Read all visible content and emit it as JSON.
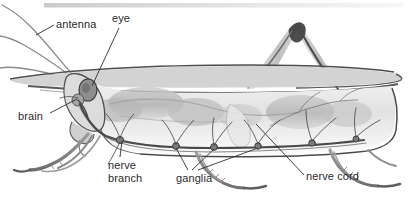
{
  "figure": {
    "width": 415,
    "height": 202,
    "background_color": "#ffffff",
    "ink_color": "#2b2b2b",
    "shading_color": "#9a9a9a"
  },
  "labels": {
    "antenna": "antenna",
    "eye": "eye",
    "brain": "brain",
    "nerve_branch_line1": "nerve",
    "nerve_branch_line2": "branch",
    "ganglia": "ganglia",
    "nerve_cord": "nerve cord"
  }
}
